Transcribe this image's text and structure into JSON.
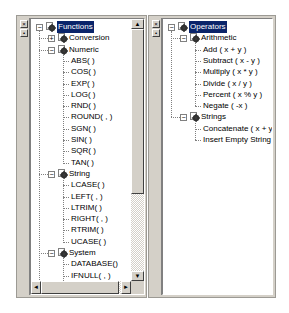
{
  "left_panel": {
    "gutter_buttons": {
      "close": "×",
      "pin": "•"
    },
    "tree": {
      "root": "Functions",
      "groups": [
        {
          "label": "Conversion",
          "expanded": false,
          "items": []
        },
        {
          "label": "Numeric",
          "expanded": true,
          "items": [
            "ABS( )",
            "COS( )",
            "EXP( )",
            "LOG( )",
            "RND( )",
            "ROUND( , )",
            "SGN( )",
            "SIN( )",
            "SQR( )",
            "TAN( )"
          ]
        },
        {
          "label": "String",
          "expanded": true,
          "items": [
            "LCASE( )",
            "LEFT( , )",
            "LTRIM( )",
            "RIGHT( , )",
            "RTRIM( )",
            "UCASE( )"
          ]
        },
        {
          "label": "System",
          "expanded": true,
          "items": [
            "DATABASE()",
            "IFNULL( , )",
            "USER()"
          ]
        },
        {
          "label": "Date/Time",
          "expanded": true,
          "items": [
            "CURDATE()"
          ]
        }
      ]
    },
    "scroll_glyphs": {
      "up": "▲",
      "down": "▼",
      "left": "◄",
      "right": "►"
    }
  },
  "right_panel": {
    "gutter_buttons": {
      "close": "×",
      "pin": "•"
    },
    "tree": {
      "root": "Operators",
      "groups": [
        {
          "label": "Arithmetic",
          "expanded": true,
          "items": [
            "Add ( x + y )",
            "Subtract ( x - y )",
            "Multiply ( x * y )",
            "Divide ( x / y )",
            "Percent ( x % y )",
            "Negate ( -x )"
          ]
        },
        {
          "label": "Strings",
          "expanded": true,
          "items": [
            "Concatenate ( x + y )",
            "Insert Empty String ( \"\" )"
          ]
        }
      ]
    }
  },
  "tree_glyphs": {
    "collapse": "−",
    "expand": "+"
  },
  "colors": {
    "selection": "#0a246a",
    "face": "#d4d0c8"
  }
}
